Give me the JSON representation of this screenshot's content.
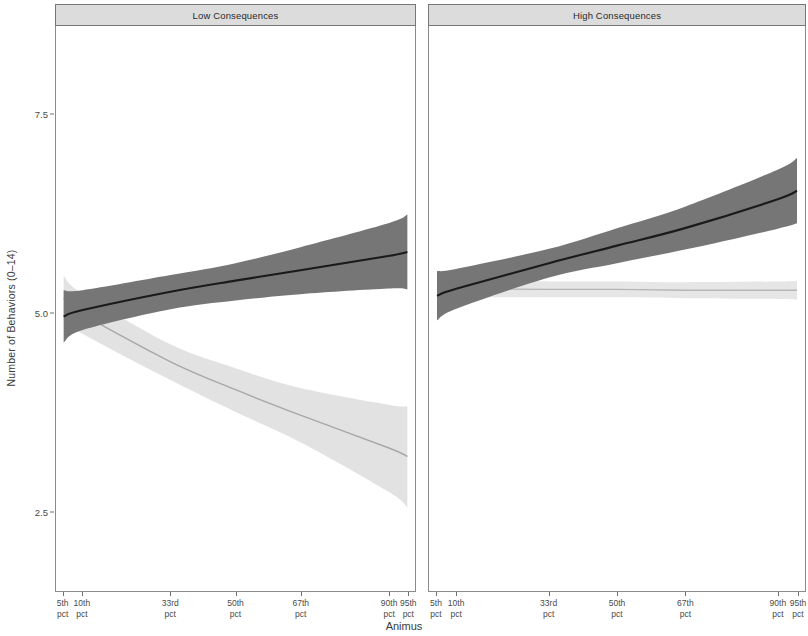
{
  "chart_data": {
    "type": "line",
    "title": "",
    "xlabel": "Animus",
    "ylabel": "Number of Behaviors (0–14)",
    "ylim": [
      1.5,
      8.6
    ],
    "yticks": [
      7.5,
      5.0,
      2.5
    ],
    "ytick_labels": [
      "7.5",
      "5.0",
      "2.5"
    ],
    "grid": false,
    "legend": "none",
    "facets": [
      {
        "label": "Low Consequences",
        "x": [
          "5th pct",
          "10th pct",
          "33rd pct",
          "50th pct",
          "67th pct",
          "90th pct",
          "95th pct"
        ],
        "x_positions": [
          0.05,
          0.1,
          0.33,
          0.5,
          0.67,
          0.9,
          0.95
        ],
        "series": [
          {
            "name": "dark-line",
            "color": "#1a1a1a",
            "band_color": "#767676",
            "values": [
              4.95,
              5.03,
              5.26,
              5.4,
              5.53,
              5.71,
              5.76
            ],
            "band_lower": [
              4.62,
              4.78,
              5.04,
              5.15,
              5.23,
              5.3,
              5.29
            ],
            "band_upper": [
              5.28,
              5.28,
              5.47,
              5.62,
              5.82,
              6.12,
              6.23
            ]
          },
          {
            "name": "light-line",
            "color": "#a8a8a8",
            "band_color": "#e2e2e2",
            "values": [
              5.18,
              4.98,
              4.38,
              4.03,
              3.71,
              3.3,
              3.19
            ],
            "band_lower": [
              4.9,
              4.73,
              4.15,
              3.75,
              3.37,
              2.75,
              2.55
            ],
            "band_upper": [
              5.46,
              5.23,
              4.6,
              4.3,
              4.05,
              3.84,
              3.82
            ]
          }
        ]
      },
      {
        "label": "High Consequences",
        "x": [
          "5th pct",
          "10th pct",
          "33rd pct",
          "50th pct",
          "67th pct",
          "90th pct",
          "95th pct"
        ],
        "x_positions": [
          0.05,
          0.1,
          0.33,
          0.5,
          0.67,
          0.9,
          0.95
        ],
        "series": [
          {
            "name": "dark-line",
            "color": "#1a1a1a",
            "band_color": "#767676",
            "values": [
              5.21,
              5.3,
              5.62,
              5.84,
              6.06,
              6.42,
              6.53
            ],
            "band_lower": [
              4.9,
              5.05,
              5.44,
              5.62,
              5.79,
              6.05,
              6.12
            ],
            "band_upper": [
              5.52,
              5.55,
              5.8,
              6.06,
              6.33,
              6.79,
              6.94
            ]
          },
          {
            "name": "light-line",
            "color": "#b5b5b5",
            "band_color": "#e6e6e6",
            "values": [
              5.3,
              5.3,
              5.29,
              5.29,
              5.28,
              5.28,
              5.28
            ],
            "band_lower": [
              5.18,
              5.19,
              5.19,
              5.19,
              5.18,
              5.17,
              5.16
            ],
            "band_upper": [
              5.42,
              5.41,
              5.39,
              5.39,
              5.38,
              5.39,
              5.4
            ]
          }
        ]
      }
    ]
  },
  "axes": {
    "y_title": "Number of Behaviors (0–14)",
    "x_title": "Animus",
    "y_ticks": [
      {
        "label": "7.5",
        "value": 7.5
      },
      {
        "label": "5.0",
        "value": 5.0
      },
      {
        "label": "2.5",
        "value": 2.5
      }
    ],
    "x_ticks": [
      {
        "line1": "5th",
        "line2": "pct",
        "value": 0.05
      },
      {
        "line1": "10th",
        "line2": "pct",
        "value": 0.1
      },
      {
        "line1": "33rd",
        "line2": "pct",
        "value": 0.33
      },
      {
        "line1": "50th",
        "line2": "pct",
        "value": 0.5
      },
      {
        "line1": "67th",
        "line2": "pct",
        "value": 0.67
      },
      {
        "line1": "90th",
        "line2": "pct",
        "value": 0.9
      },
      {
        "line1": "95th",
        "line2": "pct",
        "value": 0.95
      }
    ]
  },
  "panels": [
    {
      "label": "Low Consequences"
    },
    {
      "label": "High Consequences"
    }
  ],
  "colors": {
    "dark_line": "#1a1a1a",
    "dark_band": "#767676",
    "light_line": "#a8a8a8",
    "light_band": "#e2e2e2",
    "strip_background": "#dcdcdc",
    "panel_border": "#8a8a8a",
    "text": "#3a3a3a"
  }
}
